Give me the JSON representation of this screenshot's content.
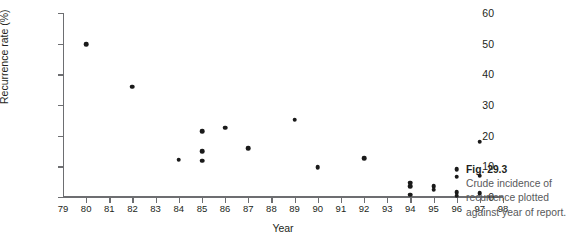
{
  "figure": {
    "caption_number": "Fig. 29.3",
    "caption_text": "Crude incidence of recurrence plotted against year of report."
  },
  "chart_data": {
    "type": "scatter",
    "title": "",
    "xlabel": "Year",
    "ylabel": "Recurrence rate (%)",
    "xlim": [
      79,
      98
    ],
    "ylim": [
      0,
      60
    ],
    "xticks": [
      79,
      80,
      81,
      82,
      83,
      84,
      85,
      86,
      87,
      88,
      89,
      90,
      91,
      92,
      93,
      94,
      95,
      96,
      97,
      98
    ],
    "xticklabels": [
      "79",
      "80",
      "81",
      "82",
      "83",
      "84",
      "85",
      "86",
      "87",
      "88",
      "89",
      "90",
      "91",
      "92",
      "93",
      "94",
      "95",
      "96",
      "97",
      "98"
    ],
    "yticks": [
      0,
      10,
      20,
      30,
      40,
      50,
      60
    ],
    "yticklabels": [
      "0",
      "10",
      "20",
      "30",
      "40",
      "50",
      "60"
    ],
    "grid": false,
    "legend": false,
    "marker": "filled-circle",
    "marker_color": "#1a1a1a",
    "points": [
      {
        "x": 80,
        "y": 49.8
      },
      {
        "x": 82,
        "y": 36.0
      },
      {
        "x": 84,
        "y": 12.2
      },
      {
        "x": 85,
        "y": 21.5
      },
      {
        "x": 85,
        "y": 15.0
      },
      {
        "x": 85,
        "y": 11.8
      },
      {
        "x": 86,
        "y": 22.6
      },
      {
        "x": 87,
        "y": 16.0
      },
      {
        "x": 89,
        "y": 25.2
      },
      {
        "x": 90,
        "y": 9.8
      },
      {
        "x": 92,
        "y": 12.6
      },
      {
        "x": 94,
        "y": 4.6
      },
      {
        "x": 94,
        "y": 3.6
      },
      {
        "x": 94,
        "y": 0.7
      },
      {
        "x": 95,
        "y": 3.6
      },
      {
        "x": 95,
        "y": 2.4
      },
      {
        "x": 96,
        "y": 9.0
      },
      {
        "x": 96,
        "y": 6.6
      },
      {
        "x": 96,
        "y": 1.6
      },
      {
        "x": 96,
        "y": 0.4
      },
      {
        "x": 97,
        "y": 18.0
      },
      {
        "x": 97,
        "y": 7.0
      },
      {
        "x": 97,
        "y": 1.2
      }
    ]
  },
  "colors": {
    "axis": "#6d6e71",
    "marker": "#1a1a1a",
    "text": "#231f20",
    "caption": "#58595b",
    "background": "#ffffff"
  }
}
